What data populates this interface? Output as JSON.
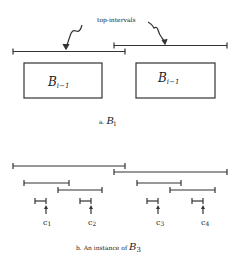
{
  "part_a": {
    "annotation": "top-intervals",
    "boxes": [
      {
        "label": "B",
        "subscript": "i−1"
      },
      {
        "label": "B",
        "subscript": "i−1"
      }
    ],
    "caption_prefix": "a.",
    "caption_symbol": "B",
    "caption_sub": "i"
  },
  "part_b": {
    "points": [
      {
        "label": "c",
        "sub": "1"
      },
      {
        "label": "c",
        "sub": "2"
      },
      {
        "label": "c",
        "sub": "3"
      },
      {
        "label": "c",
        "sub": "4"
      }
    ],
    "caption_prefix": "b. An instance of",
    "caption_symbol": "B",
    "caption_sub": "3"
  }
}
